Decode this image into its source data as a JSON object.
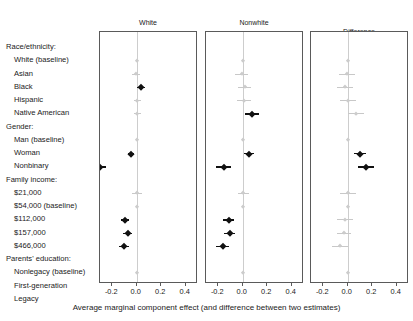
{
  "chart_data": {
    "type": "scatter",
    "title": "",
    "xlabel": "Average marginal component effect (and difference between two estimates)",
    "ylabel": "",
    "xlim": [
      -0.3,
      0.5
    ],
    "xticks": [
      -0.2,
      0.0,
      0.2,
      0.4
    ],
    "xticklabels": [
      "-0.2",
      "0.0",
      "0.2",
      "0.4"
    ],
    "grid": false,
    "legend": "none",
    "panels": [
      {
        "name": "white",
        "label": "White",
        "n_label": "(N = 428)",
        "n": 428
      },
      {
        "name": "nonwhite",
        "label": "Nonwhite",
        "n_label": "(N = 156)",
        "n": 156
      },
      {
        "name": "difference",
        "label": "Difference",
        "n_label": "",
        "n": null
      }
    ],
    "rows": [
      {
        "label": "Race/ethnicity:",
        "type": "header"
      },
      {
        "label": "White (baseline)",
        "type": "item",
        "baseline": true,
        "white": {
          "est": 0.0,
          "lo": 0.0,
          "hi": 0.0,
          "sig": false
        },
        "nonwhite": {
          "est": 0.0,
          "lo": 0.0,
          "hi": 0.0,
          "sig": false
        },
        "difference": {
          "est": 0.0,
          "lo": 0.0,
          "hi": 0.0,
          "sig": false
        }
      },
      {
        "label": "Asian",
        "type": "item",
        "white": {
          "est": -0.005,
          "lo": -0.035,
          "hi": 0.025,
          "sig": false
        },
        "nonwhite": {
          "est": -0.01,
          "lo": -0.065,
          "hi": 0.045,
          "sig": false
        },
        "difference": {
          "est": -0.005,
          "lo": -0.07,
          "hi": 0.06,
          "sig": false
        }
      },
      {
        "label": "Black",
        "type": "item",
        "white": {
          "est": 0.035,
          "lo": 0.005,
          "hi": 0.065,
          "sig": true
        },
        "nonwhite": {
          "est": 0.015,
          "lo": -0.04,
          "hi": 0.07,
          "sig": false
        },
        "difference": {
          "est": -0.02,
          "lo": -0.085,
          "hi": 0.045,
          "sig": false
        }
      },
      {
        "label": "Hispanic",
        "type": "item",
        "white": {
          "est": 0.005,
          "lo": -0.025,
          "hi": 0.035,
          "sig": false
        },
        "nonwhite": {
          "est": 0.01,
          "lo": -0.045,
          "hi": 0.065,
          "sig": false
        },
        "difference": {
          "est": 0.005,
          "lo": -0.06,
          "hi": 0.07,
          "sig": false
        }
      },
      {
        "label": "Native American",
        "type": "item",
        "white": {
          "est": 0.005,
          "lo": -0.025,
          "hi": 0.035,
          "sig": false
        },
        "nonwhite": {
          "est": 0.075,
          "lo": 0.02,
          "hi": 0.13,
          "sig": true
        },
        "difference": {
          "est": 0.07,
          "lo": 0.005,
          "hi": 0.135,
          "sig": false
        }
      },
      {
        "label": "Gender:",
        "type": "header"
      },
      {
        "label": "Man (baseline)",
        "type": "item",
        "baseline": true,
        "white": {
          "est": 0.0,
          "lo": 0.0,
          "hi": 0.0,
          "sig": false
        },
        "nonwhite": {
          "est": 0.0,
          "lo": 0.0,
          "hi": 0.0,
          "sig": false
        },
        "difference": {
          "est": 0.0,
          "lo": 0.0,
          "hi": 0.0,
          "sig": false
        }
      },
      {
        "label": "Woman",
        "type": "item",
        "white": {
          "est": -0.05,
          "lo": -0.075,
          "hi": -0.025,
          "sig": true
        },
        "nonwhite": {
          "est": 0.05,
          "lo": 0.01,
          "hi": 0.09,
          "sig": true
        },
        "difference": {
          "est": 0.1,
          "lo": 0.055,
          "hi": 0.145,
          "sig": true
        }
      },
      {
        "label": "Nonbinary",
        "type": "item",
        "white": {
          "est": -0.3,
          "lo": -0.34,
          "hi": -0.255,
          "sig": true
        },
        "nonwhite": {
          "est": -0.155,
          "lo": -0.215,
          "hi": -0.095,
          "sig": true
        },
        "difference": {
          "est": 0.15,
          "lo": 0.085,
          "hi": 0.215,
          "sig": true
        }
      },
      {
        "label": "Family income:",
        "type": "header"
      },
      {
        "label": "$21,000",
        "type": "item",
        "white": {
          "est": 0.005,
          "lo": -0.035,
          "hi": 0.045,
          "sig": false
        },
        "nonwhite": {
          "est": 0.005,
          "lo": -0.04,
          "hi": 0.05,
          "sig": false
        },
        "difference": {
          "est": 0.0,
          "lo": -0.065,
          "hi": 0.065,
          "sig": false
        }
      },
      {
        "label": "$54,000 (baseline)",
        "type": "item",
        "baseline": true,
        "white": {
          "est": 0.0,
          "lo": 0.0,
          "hi": 0.0,
          "sig": false
        },
        "nonwhite": {
          "est": 0.0,
          "lo": 0.0,
          "hi": 0.0,
          "sig": false
        },
        "difference": {
          "est": 0.0,
          "lo": 0.0,
          "hi": 0.0,
          "sig": false
        }
      },
      {
        "label": "$112,000",
        "type": "item",
        "white": {
          "est": -0.095,
          "lo": -0.13,
          "hi": -0.06,
          "sig": true
        },
        "nonwhite": {
          "est": -0.115,
          "lo": -0.16,
          "hi": -0.07,
          "sig": true
        },
        "difference": {
          "est": -0.02,
          "lo": -0.085,
          "hi": 0.045,
          "sig": false
        }
      },
      {
        "label": "$157,000",
        "type": "item",
        "white": {
          "est": -0.075,
          "lo": -0.11,
          "hi": -0.04,
          "sig": true
        },
        "nonwhite": {
          "est": -0.105,
          "lo": -0.15,
          "hi": -0.06,
          "sig": true
        },
        "difference": {
          "est": -0.03,
          "lo": -0.09,
          "hi": 0.03,
          "sig": false
        }
      },
      {
        "label": "$466,000",
        "type": "item",
        "white": {
          "est": -0.105,
          "lo": -0.145,
          "hi": -0.065,
          "sig": true
        },
        "nonwhite": {
          "est": -0.165,
          "lo": -0.215,
          "hi": -0.115,
          "sig": true
        },
        "difference": {
          "est": -0.06,
          "lo": -0.125,
          "hi": 0.005,
          "sig": false
        }
      },
      {
        "label": "Parents' education:",
        "type": "header"
      },
      {
        "label": "Nonlegacy (baseline)",
        "type": "item",
        "baseline": true,
        "white": {
          "est": 0.0,
          "lo": 0.0,
          "hi": 0.0,
          "sig": false
        },
        "nonwhite": {
          "est": 0.0,
          "lo": 0.0,
          "hi": 0.0,
          "sig": false
        },
        "difference": {
          "est": 0.0,
          "lo": 0.0,
          "hi": 0.0,
          "sig": false
        }
      },
      {
        "label": "First-generation",
        "type": "item",
        "white": {
          "est": 0.035,
          "lo": 0.01,
          "hi": 0.06,
          "sig": true
        },
        "nonwhite": {
          "est": 0.06,
          "lo": 0.025,
          "hi": 0.095,
          "sig": true
        },
        "difference": {
          "est": 0.025,
          "lo": -0.015,
          "hi": 0.065,
          "sig": true
        }
      },
      {
        "label": "Legacy",
        "type": "item",
        "white": {
          "est": 0.045,
          "lo": 0.02,
          "hi": 0.07,
          "sig": true
        },
        "nonwhite": {
          "est": 0.045,
          "lo": 0.01,
          "hi": 0.08,
          "sig": true
        },
        "difference": {
          "est": 0.0,
          "lo": -0.04,
          "hi": 0.04,
          "sig": false
        }
      }
    ],
    "colors": {
      "significant": "#111111",
      "nonsignificant": "#cccccc",
      "zero_line": "#cdcdcd",
      "axis": "#5a5a5a",
      "text": "#1a1a1a"
    }
  }
}
